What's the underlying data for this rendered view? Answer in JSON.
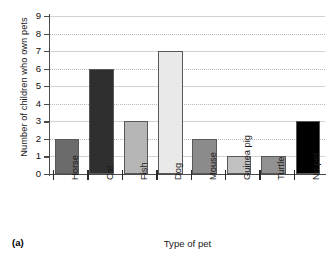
{
  "caption": "(a)",
  "chart_data": {
    "type": "bar",
    "title": "",
    "xlabel": "Type of pet",
    "ylabel": "Number of children who own pets",
    "categories": [
      "Horse",
      "Cat",
      "Fish",
      "Dog",
      "Mouse",
      "Guinea pig",
      "Turtle",
      "No pet"
    ],
    "values": [
      2,
      6,
      3,
      7,
      2,
      1,
      1,
      3
    ],
    "bar_colors": [
      "#6b6b6b",
      "#2f2f2f",
      "#b6b6b6",
      "#e9e9e9",
      "#8b8b8b",
      "#c1c1c1",
      "#919191",
      "#000000"
    ],
    "bar_edge_color": "#585858",
    "ylim": [
      0,
      9
    ],
    "yticks": [
      0,
      1,
      2,
      3,
      4,
      5,
      6,
      7,
      8,
      9
    ],
    "ytick_labels": [
      "0",
      "1",
      "2",
      "3",
      "4",
      "5",
      "6",
      "7",
      "8",
      "9"
    ],
    "grid": true,
    "grid_color": "#b9b9b9",
    "legend": "none",
    "axis_color": "#4a4a4a"
  }
}
